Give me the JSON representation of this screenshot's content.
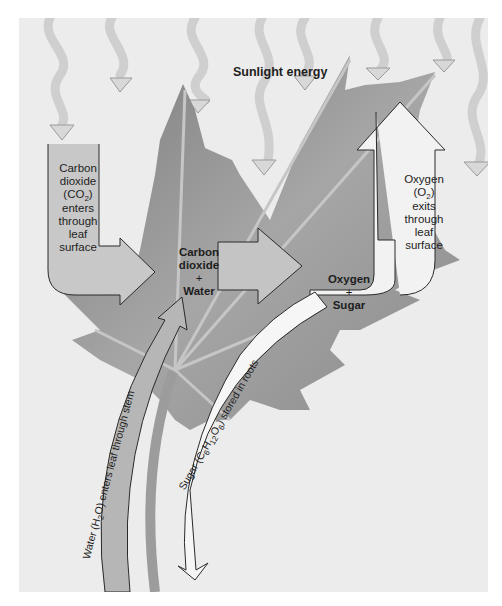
{
  "diagram": {
    "title": "Sunlight energy",
    "inputs": {
      "co2": {
        "lines": [
          "Carbon",
          "dioxide",
          "(CO",
          "2",
          ")",
          "enters",
          "through",
          "leaf",
          "surface"
        ]
      },
      "water": {
        "text_prefix": "Water (H",
        "sub": "2",
        "text_suffix": "O) enters leaf through stem"
      }
    },
    "reactants": {
      "line1": "Carbon",
      "line2": "dioxide",
      "plus": "+",
      "line3": "Water"
    },
    "products": {
      "line1": "Oxygen",
      "plus": "+",
      "line2": "Sugar"
    },
    "outputs": {
      "o2": {
        "lines": [
          "Oxygen",
          "(O",
          "2",
          ")",
          "exits",
          "through",
          "leaf",
          "surface"
        ]
      },
      "sugar": {
        "text": "Sugar (C6H12O6) stored in roots",
        "p1": "Sugar (C",
        "s1": "6",
        "p2": "H",
        "s2": "12",
        "p3": "O",
        "s3": "6",
        "p4": ") stored in roots"
      }
    },
    "colors": {
      "background": "#ececec",
      "leaf_dark": "#8a8a8a",
      "leaf_light": "#b4b4b4",
      "arrow_fill": "#c4c4c4",
      "arrow_stroke": "#2a2a2a",
      "sun_arrow": "#dadada",
      "white_arrow": "#f6f6f6"
    }
  }
}
